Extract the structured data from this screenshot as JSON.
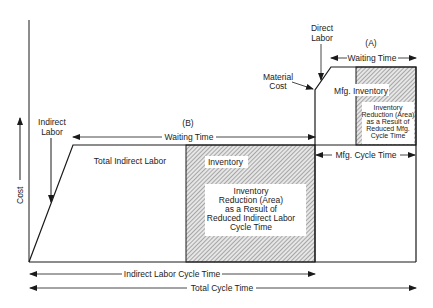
{
  "axis": {
    "y_label": "Cost"
  },
  "labels": {
    "indirect_labor": [
      "Indirect",
      "Labor"
    ],
    "total_indirect_labor": "Total Indirect Labor",
    "b_marker": "(B)",
    "waiting_time_b": "Waiting Time",
    "inventory": "Inventory",
    "inventory_reduction_b": [
      "Inventory",
      "Reduction (Area)",
      "as a Result of",
      "Reduced Indirect Labor",
      "Cycle Time"
    ],
    "material_cost": [
      "Material",
      "Cost"
    ],
    "direct_labor": [
      "Direct",
      "Labor"
    ],
    "a_marker": "(A)",
    "waiting_time_a": "Waiting Time",
    "mfg_inventory": "Mfg. Inventory",
    "inventory_reduction_a": [
      "Inventory",
      "Reduction (Area)",
      "as a Result of",
      "Reduced Mfg.",
      "Cycle Time"
    ],
    "mfg_cycle_time": "Mfg. Cycle Time",
    "indirect_labor_cycle_time": "Indirect Labor Cycle Time",
    "total_cycle_time": "Total Cycle Time"
  },
  "colors": {
    "line": "#1a1a1a",
    "hatch": "#555555",
    "background": "#ffffff"
  }
}
